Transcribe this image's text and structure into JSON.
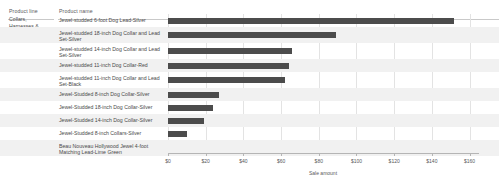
{
  "table": {
    "columns": {
      "product_line": "Product line",
      "product_name": "Product name"
    },
    "category_label": "Collars,\nHarnesses &\nLeashes"
  },
  "axis": {
    "title": "Sale amount",
    "ticks": [
      "$0",
      "$20",
      "$40",
      "$60",
      "$80",
      "$100",
      "$120",
      "$140",
      "$160"
    ]
  },
  "colors": {
    "bar": "#4c4c4c",
    "band": "#f1f1f1",
    "grid": "#e3e3e3",
    "text": "#4a4a4a"
  },
  "chart_data": {
    "type": "bar",
    "orientation": "horizontal",
    "title": "",
    "xlabel": "Sale amount",
    "ylabel": "Product name",
    "xlim": [
      0,
      165
    ],
    "grid": true,
    "legend": "none",
    "tick_values": [
      0,
      20,
      40,
      60,
      80,
      100,
      120,
      140,
      160
    ],
    "tick_labels": [
      "$0",
      "$20",
      "$40",
      "$60",
      "$80",
      "$100",
      "$120",
      "$140",
      "$160"
    ],
    "group": "Collars, Harnesses & Leashes",
    "categories": [
      "Jewel-studded 6-foot Dog Lead-Silver",
      "Jewel-studded 18-inch Dog Collar and Lead Set-Silver",
      "Jewel-studded 14-inch Dog Collar and Lead Set-Silver",
      "Jewel-studded 11-inch Dog Collar-Red",
      "Jewel-studded 11-inch Dog Collar and Lead Set-Black",
      "Jewel-Studded 8-inch Dog Collar-Silver",
      "Jewel-Studded 18-inch Dog Collar-Silver",
      "Jewel-Studded 14-inch Dog Collar-Silver",
      "Jewel-Studded 8-inch Collars-Silver",
      "Beau Nouveau Hollywood Jewel 4-foot Matching Lead-Lime Green"
    ],
    "values": [
      152,
      89,
      66,
      64,
      62,
      27,
      24,
      19,
      10,
      0
    ]
  }
}
